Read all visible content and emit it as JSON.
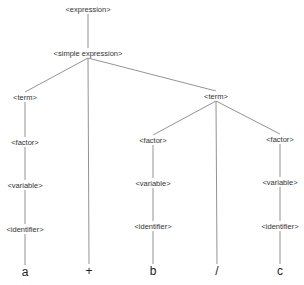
{
  "diagram": {
    "type": "parse-tree",
    "nodes": [
      {
        "id": "expression",
        "label": "<expression>",
        "x": 88,
        "y": 9
      },
      {
        "id": "simple_expression",
        "label": "<simple expression>",
        "x": 88,
        "y": 53
      },
      {
        "id": "term_left",
        "label": "<term>",
        "x": 25,
        "y": 97
      },
      {
        "id": "term_right",
        "label": "<term>",
        "x": 216,
        "y": 96
      },
      {
        "id": "factor_a",
        "label": "<factor>",
        "x": 25,
        "y": 142
      },
      {
        "id": "factor_b",
        "label": "<factor>",
        "x": 153,
        "y": 140
      },
      {
        "id": "factor_c",
        "label": "<factor>",
        "x": 280,
        "y": 139
      },
      {
        "id": "variable_a",
        "label": "<variable>",
        "x": 25,
        "y": 185
      },
      {
        "id": "variable_b",
        "label": "<variable>",
        "x": 153,
        "y": 183
      },
      {
        "id": "variable_c",
        "label": "<variable>",
        "x": 280,
        "y": 182
      },
      {
        "id": "identifier_a",
        "label": "<identifier>",
        "x": 25,
        "y": 229
      },
      {
        "id": "identifier_b",
        "label": "<identifier>",
        "x": 153,
        "y": 226
      },
      {
        "id": "identifier_c",
        "label": "<identifier>",
        "x": 280,
        "y": 226
      },
      {
        "id": "leaf_a",
        "label": "a",
        "x": 25,
        "y": 272,
        "leaf": true
      },
      {
        "id": "leaf_plus",
        "label": "+",
        "x": 89,
        "y": 271,
        "leaf": true
      },
      {
        "id": "leaf_b",
        "label": "b",
        "x": 153,
        "y": 271,
        "leaf": true
      },
      {
        "id": "leaf_slash",
        "label": "/",
        "x": 217,
        "y": 271,
        "leaf": true
      },
      {
        "id": "leaf_c",
        "label": "c",
        "x": 280,
        "y": 271,
        "leaf": true
      }
    ],
    "edges": [
      [
        "expression",
        "simple_expression"
      ],
      [
        "simple_expression",
        "term_left"
      ],
      [
        "simple_expression",
        "leaf_plus"
      ],
      [
        "simple_expression",
        "term_right"
      ],
      [
        "term_left",
        "factor_a"
      ],
      [
        "factor_a",
        "variable_a"
      ],
      [
        "variable_a",
        "identifier_a"
      ],
      [
        "identifier_a",
        "leaf_a"
      ],
      [
        "term_right",
        "factor_b"
      ],
      [
        "term_right",
        "leaf_slash"
      ],
      [
        "term_right",
        "factor_c"
      ],
      [
        "factor_b",
        "variable_b"
      ],
      [
        "variable_b",
        "identifier_b"
      ],
      [
        "identifier_b",
        "leaf_b"
      ],
      [
        "factor_c",
        "variable_c"
      ],
      [
        "variable_c",
        "identifier_c"
      ],
      [
        "identifier_c",
        "leaf_c"
      ]
    ],
    "line_color": "#777777"
  }
}
